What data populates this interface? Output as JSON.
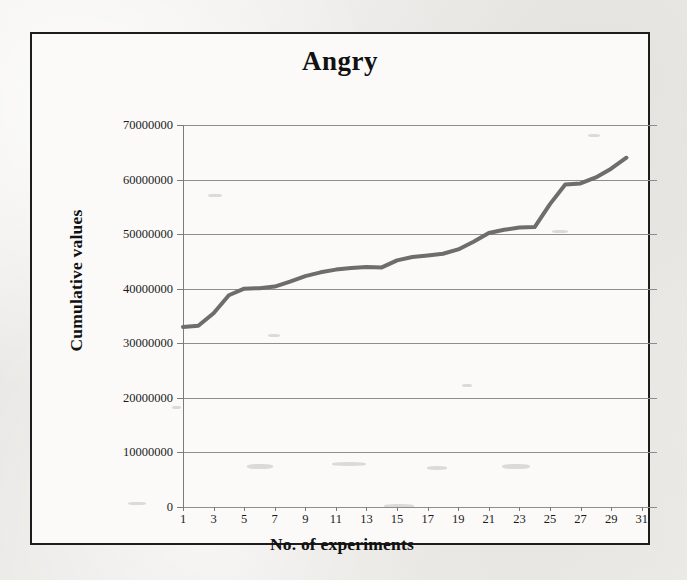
{
  "figure": {
    "title": "Angry",
    "frame_color": "#1d1d1d",
    "plot_background": "#fbfaf9"
  },
  "axes": {
    "y_title": "Cumulative values",
    "x_title": "No. of experiments",
    "y_tick_labels": [
      "70000000",
      "60000000",
      "50000000",
      "40000000",
      "30000000",
      "20000000",
      "10000000",
      "0"
    ],
    "x_tick_labels": [
      "1",
      "3",
      "5",
      "7",
      "9",
      "11",
      "13",
      "15",
      "17",
      "19",
      "21",
      "23",
      "25",
      "27",
      "29",
      "31"
    ]
  },
  "chart_data": {
    "type": "line",
    "title": "Angry",
    "xlabel": "No. of experiments",
    "ylabel": "Cumulative values",
    "xlim": [
      1,
      32
    ],
    "ylim": [
      0,
      70000000
    ],
    "ytick_step": 10000000,
    "grid": true,
    "legend": null,
    "line_color": "#6e6d6b",
    "line_width": 4,
    "x": [
      1,
      2,
      3,
      4,
      5,
      6,
      7,
      8,
      9,
      10,
      11,
      12,
      13,
      14,
      15,
      16,
      17,
      18,
      19,
      20,
      21,
      22,
      23,
      24,
      25,
      26,
      27,
      28,
      29,
      30
    ],
    "values": [
      33000000,
      33200000,
      35500000,
      38800000,
      40000000,
      40100000,
      40400000,
      41300000,
      42300000,
      43000000,
      43500000,
      43800000,
      44000000,
      43900000,
      45200000,
      45800000,
      46100000,
      46400000,
      47200000,
      48600000,
      50200000,
      50800000,
      51200000,
      51300000,
      55500000,
      59100000,
      59300000,
      60400000,
      62000000,
      64000000
    ],
    "series": [
      {
        "name": "Angry",
        "values": [
          33000000,
          33200000,
          35500000,
          38800000,
          40000000,
          40100000,
          40400000,
          41300000,
          42300000,
          43000000,
          43500000,
          43800000,
          44000000,
          43900000,
          45200000,
          45800000,
          46100000,
          46400000,
          47200000,
          48600000,
          50200000,
          50800000,
          51200000,
          51300000,
          55500000,
          59100000,
          59300000,
          60400000,
          62000000,
          64000000
        ]
      }
    ]
  }
}
